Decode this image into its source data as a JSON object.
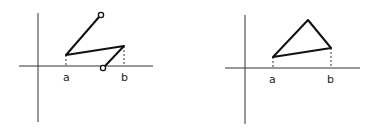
{
  "panels": [
    {
      "name": "left-graph",
      "labels": {
        "a": "a",
        "b": "b"
      },
      "description": "Piecewise path: open circle top, down to a, to b, down to open circle on x-axis"
    },
    {
      "name": "right-graph",
      "labels": {
        "a": "a",
        "b": "b"
      },
      "description": "Closed triangle with vertices above a, peak, and above b"
    }
  ],
  "colors": {
    "stroke": "#111111",
    "axis": "#333333"
  }
}
